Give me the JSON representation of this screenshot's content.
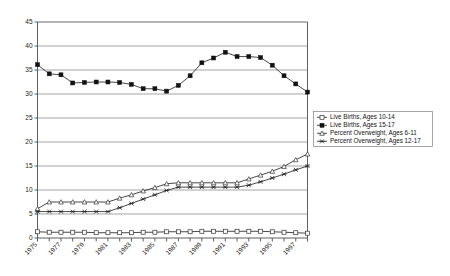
{
  "chart_data": {
    "type": "line",
    "title": "",
    "xlabel": "",
    "ylabel": "",
    "ylim": [
      0,
      45
    ],
    "ytick_step": 5,
    "yticks": [
      0,
      5,
      10,
      15,
      20,
      25,
      30,
      35,
      40,
      45
    ],
    "grid": true,
    "legend_position": "right-middle",
    "x": [
      1975,
      1976,
      1977,
      1978,
      1979,
      1980,
      1981,
      1982,
      1983,
      1984,
      1985,
      1986,
      1987,
      1988,
      1989,
      1990,
      1991,
      1992,
      1993,
      1994,
      1995,
      1996,
      1997,
      1998
    ],
    "xtick_labels": [
      "1975",
      "",
      "1977",
      "",
      "1979",
      "",
      "1981",
      "",
      "1983",
      "",
      "1985",
      "",
      "1987",
      "",
      "1989",
      "",
      "1991",
      "",
      "1993",
      "",
      "1995",
      "",
      "1997",
      ""
    ],
    "series": [
      {
        "name": "Live Births, Ages 10-14",
        "marker": "open-square",
        "values": [
          1.3,
          1.2,
          1.2,
          1.2,
          1.2,
          1.1,
          1.1,
          1.1,
          1.1,
          1.2,
          1.2,
          1.3,
          1.3,
          1.3,
          1.4,
          1.4,
          1.4,
          1.4,
          1.4,
          1.4,
          1.3,
          1.2,
          1.1,
          1.0
        ]
      },
      {
        "name": "Live Births, Ages 15-17",
        "marker": "filled-square",
        "values": [
          36.1,
          34.2,
          34.0,
          32.3,
          32.4,
          32.5,
          32.5,
          32.4,
          32.0,
          31.1,
          31.1,
          30.6,
          31.8,
          33.8,
          36.5,
          37.5,
          38.7,
          37.8,
          37.8,
          37.6,
          36.0,
          33.8,
          32.1,
          30.4
        ]
      },
      {
        "name": "Percent Overweight, Ages 6-11",
        "marker": "open-triangle",
        "values": [
          6.1,
          7.5,
          7.5,
          7.5,
          7.5,
          7.5,
          7.5,
          8.3,
          9.0,
          9.8,
          10.5,
          11.3,
          11.5,
          11.5,
          11.5,
          11.5,
          11.5,
          11.5,
          12.3,
          13.1,
          13.9,
          14.9,
          16.3,
          17.5
        ]
      },
      {
        "name": "Percent Overweight, Ages 12-17",
        "marker": "x-cross",
        "values": [
          5.5,
          5.5,
          5.5,
          5.5,
          5.5,
          5.5,
          5.5,
          6.3,
          7.2,
          8.1,
          9.0,
          9.9,
          10.6,
          10.6,
          10.6,
          10.6,
          10.6,
          10.6,
          11.0,
          11.7,
          12.5,
          13.3,
          14.2,
          15.0
        ]
      }
    ]
  },
  "legend": {
    "items": [
      "Live Births, Ages 10-14",
      "Live Births, Ages 15-17",
      "Percent Overweight, Ages 6-11",
      "Percent Overweight, Ages 12-17"
    ]
  },
  "colors": {
    "line": "#1a1a1a",
    "grid": "#808080",
    "axis": "#4d4d4d",
    "background": "#ffffff"
  }
}
